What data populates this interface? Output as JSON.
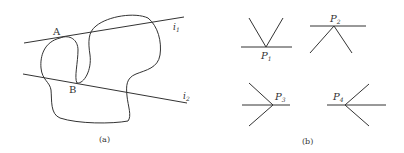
{
  "figure_a": {
    "caption": "(a)",
    "point_a_label": "A",
    "point_b_label": "B",
    "line1_label": "i",
    "line1_sub": "1",
    "line2_label": "i",
    "line2_sub": "2"
  },
  "figure_b": {
    "caption": "(b)",
    "points": [
      {
        "label": "P",
        "sub": "1"
      },
      {
        "label": "P",
        "sub": "2"
      },
      {
        "label": "P",
        "sub": "3"
      },
      {
        "label": "P",
        "sub": "4"
      }
    ]
  },
  "colors": {
    "stroke": "#333333",
    "background": "#ffffff"
  }
}
